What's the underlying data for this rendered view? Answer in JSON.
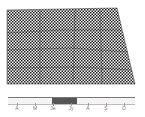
{
  "map": {
    "region_shape": "county-outline",
    "pattern": "dotted-checker",
    "fill_colors": {
      "dark": "#1a1a1a",
      "light": "#ffffff"
    }
  },
  "timeline": {
    "months": [
      {
        "label": "A",
        "x": 17
      },
      {
        "label": "M",
        "x": 35
      },
      {
        "label": "Je",
        "x": 53
      },
      {
        "label": "Jy",
        "x": 71
      },
      {
        "label": "A",
        "x": 88
      },
      {
        "label": "S",
        "x": 106
      },
      {
        "label": "O",
        "x": 124
      }
    ],
    "active_range": {
      "start_x": 52,
      "end_x": 77,
      "from": "Je",
      "to": "Jy"
    },
    "active_color": "#555555"
  }
}
